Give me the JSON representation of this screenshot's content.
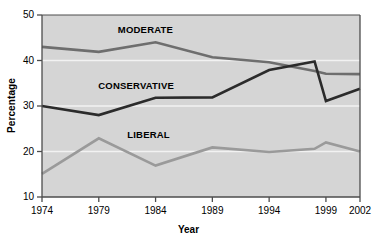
{
  "chart_data": {
    "type": "line",
    "title": "",
    "xlabel": "Year",
    "ylabel": "Percentage",
    "x": [
      1974,
      1979,
      1984,
      1989,
      1994,
      1998,
      1999,
      2002
    ],
    "xlim": [
      1974,
      2002
    ],
    "ylim": [
      10,
      50
    ],
    "yticks": [
      10,
      20,
      30,
      40,
      50
    ],
    "xticks": [
      1974,
      1979,
      1984,
      1989,
      1994,
      1999,
      2002
    ],
    "ytick_labels": [
      "10",
      "20",
      "30",
      "40",
      "50"
    ],
    "xtick_labels": [
      "1974",
      "1979",
      "1984",
      "1989",
      "1994",
      "1999",
      "2002"
    ],
    "grid": "horizontal-white",
    "legend": "inline-labels",
    "plot_background": "#d5d5d5",
    "gridline_color": "#f2f2f2",
    "axis_color": "#4d4d4d",
    "series": [
      {
        "name": "MODERATE",
        "color": "#6e6e6e",
        "label_x": 1983.1,
        "label_y": 46.6,
        "points": [
          {
            "x": 1974,
            "y": 43.0
          },
          {
            "x": 1979,
            "y": 41.9
          },
          {
            "x": 1984,
            "y": 44.0
          },
          {
            "x": 1989,
            "y": 40.7
          },
          {
            "x": 1994,
            "y": 39.6
          },
          {
            "x": 1998,
            "y": 37.7
          },
          {
            "x": 1999,
            "y": 37.1
          },
          {
            "x": 2002,
            "y": 37.0
          }
        ]
      },
      {
        "name": "CONSERVATIVE",
        "color": "#2b2b2b",
        "label_x": 1982.3,
        "label_y": 34.3,
        "points": [
          {
            "x": 1974,
            "y": 30.0
          },
          {
            "x": 1979,
            "y": 28.0
          },
          {
            "x": 1984,
            "y": 31.8
          },
          {
            "x": 1989,
            "y": 31.9
          },
          {
            "x": 1994,
            "y": 37.9
          },
          {
            "x": 1998,
            "y": 39.8
          },
          {
            "x": 1999,
            "y": 31.1
          },
          {
            "x": 2002,
            "y": 33.8
          }
        ]
      },
      {
        "name": "LIBERAL",
        "color": "#9a9a9a",
        "label_x": 1983.4,
        "label_y": 23.6,
        "points": [
          {
            "x": 1974,
            "y": 15.1
          },
          {
            "x": 1979,
            "y": 22.9
          },
          {
            "x": 1984,
            "y": 16.9
          },
          {
            "x": 1989,
            "y": 20.9
          },
          {
            "x": 1994,
            "y": 19.9
          },
          {
            "x": 1998,
            "y": 20.6
          },
          {
            "x": 1999,
            "y": 22.0
          },
          {
            "x": 2002,
            "y": 20.0
          }
        ]
      }
    ]
  }
}
